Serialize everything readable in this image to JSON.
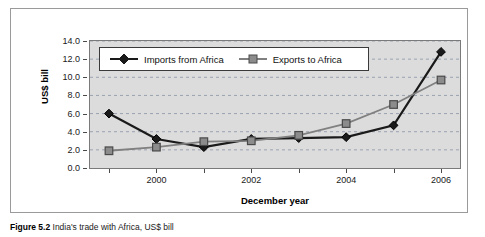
{
  "figure": {
    "caption_label": "Figure 5.2",
    "caption_text": "India's trade with Africa, US$ bill"
  },
  "chart_data": {
    "type": "line",
    "title": "",
    "xlabel": "December year",
    "ylabel": "US$ bill",
    "categories": [
      1999,
      2000,
      2001,
      2002,
      2003,
      2004,
      2005,
      2006
    ],
    "x_tick_labels": [
      "2000",
      "2002",
      "2004",
      "2006"
    ],
    "x_tick_values": [
      2000,
      2002,
      2004,
      2006
    ],
    "y_tick_labels": [
      "0.0",
      "2.0",
      "4.0",
      "6.0",
      "8.0",
      "10.0",
      "12.0",
      "14.0"
    ],
    "y_tick_values": [
      0.0,
      2.0,
      4.0,
      6.0,
      8.0,
      10.0,
      12.0,
      14.0
    ],
    "ylim": [
      0.0,
      14.0
    ],
    "xlim": [
      1998.6,
      2006.4
    ],
    "grid": true,
    "grid_style": "dashed-horizontal",
    "legend_position": "top-left-inside",
    "plot_background": "#dcdcdc",
    "series": [
      {
        "name": "Imports from Africa",
        "marker": "diamond",
        "color": "#1a1a1a",
        "values": [
          6.0,
          3.2,
          2.3,
          3.2,
          3.3,
          3.4,
          4.7,
          12.8
        ]
      },
      {
        "name": "Exports to Africa",
        "marker": "square",
        "color": "#808080",
        "values": [
          1.9,
          2.3,
          2.9,
          3.0,
          3.6,
          4.9,
          7.0,
          9.7
        ]
      }
    ]
  }
}
